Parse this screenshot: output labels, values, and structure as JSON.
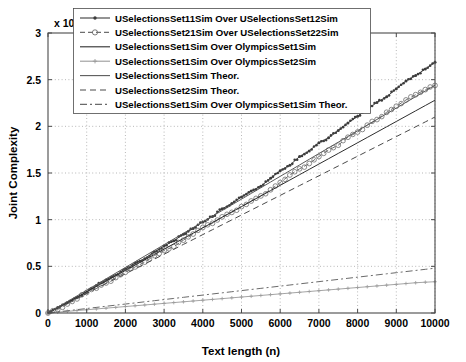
{
  "chart": {
    "type": "line",
    "title": "",
    "xlabel": "Text length (n)",
    "ylabel": "Joint Complexity",
    "y_exponent_prefix": "x 10",
    "y_exponent_power": "4",
    "xlim": [
      0,
      10000
    ],
    "ylim": [
      0,
      30000
    ],
    "xticks": [
      "0",
      "1000",
      "2000",
      "3000",
      "4000",
      "5000",
      "6000",
      "7000",
      "8000",
      "9000",
      "10000"
    ],
    "yticks": [
      "0",
      "0.5",
      "1",
      "1.5",
      "2",
      "2.5",
      "3"
    ],
    "grid": true,
    "legend_position": "top-center"
  },
  "legend": {
    "entries": [
      {
        "label": "USelectionsSet11Sim Over USelectionsSet12Sim",
        "style": "solid-dot",
        "color": "#3c3c3c"
      },
      {
        "label": "USelectionsSet21Sim Over USelectionsSet22Sim",
        "style": "dashed-circle",
        "color": "#6e6e6e"
      },
      {
        "label": "USelectionsSet1Sim Over OlympicsSet1Sim",
        "style": "solid",
        "color": "#2e2e2e"
      },
      {
        "label": "USelectionsSet1Sim Over OlympicsSet2Sim",
        "style": "solid-plus",
        "color": "#9a9a9a"
      },
      {
        "label": "USelectionsSet1Sim Theor.",
        "style": "solid",
        "color": "#5a5a5a"
      },
      {
        "label": "USelectionsSet2Sim Theor.",
        "style": "dashed",
        "color": "#4a4a4a"
      },
      {
        "label": "USelectionsSet1Sim Over OlympicsSet1Sim Theor.",
        "style": "dashdot",
        "color": "#6a6a6a"
      }
    ]
  },
  "chart_data": {
    "type": "line",
    "title": "",
    "xlabel": "Text length (n)",
    "ylabel": "Joint Complexity",
    "xlim": [
      0,
      10000
    ],
    "ylim": [
      0,
      30000
    ],
    "y_scale_factor": 10000,
    "grid": true,
    "legend_position": "top-center",
    "x": [
      0,
      250,
      500,
      750,
      1000,
      1250,
      1500,
      1750,
      2000,
      2250,
      2500,
      2750,
      3000,
      3250,
      3500,
      3750,
      4000,
      4250,
      4500,
      4750,
      5000,
      5250,
      5500,
      5750,
      6000,
      6250,
      6500,
      6750,
      7000,
      7250,
      7500,
      7750,
      8000,
      8250,
      8500,
      8750,
      9000,
      9250,
      9500,
      9750,
      10000
    ],
    "series": [
      {
        "name": "USelectionsSet11Sim Over USelectionsSet12Sim",
        "style": "solid-dot",
        "color": "#3c3c3c",
        "values": [
          0,
          520,
          1080,
          1680,
          2280,
          2880,
          3480,
          4080,
          4700,
          5320,
          5930,
          6530,
          7150,
          7760,
          8360,
          9100,
          9780,
          10400,
          11050,
          11680,
          12350,
          13000,
          13680,
          14400,
          15150,
          15900,
          16700,
          17450,
          18150,
          18850,
          19600,
          20350,
          21100,
          21850,
          22550,
          23250,
          24000,
          24750,
          25500,
          26200,
          26800
        ]
      },
      {
        "name": "USelectionsSet21Sim Over USelectionsSet22Sim",
        "style": "dashed-circle",
        "color": "#6e6e6e",
        "values": [
          0,
          480,
          1000,
          1550,
          2100,
          2650,
          3200,
          3780,
          4350,
          4920,
          5480,
          6050,
          6620,
          7180,
          7750,
          8420,
          9060,
          9620,
          10200,
          10780,
          11400,
          12000,
          12640,
          13300,
          14000,
          14700,
          15430,
          16100,
          16750,
          17400,
          18100,
          18800,
          19500,
          20150,
          20800,
          21450,
          22100,
          22750,
          23400,
          23950,
          24400
        ]
      },
      {
        "name": "USelectionsSet1Sim Over OlympicsSet1Sim",
        "style": "solid",
        "color": "#2e2e2e",
        "values": [
          0,
          570,
          1140,
          1710,
          2280,
          2850,
          3420,
          3990,
          4560,
          5130,
          5700,
          6270,
          6840,
          7410,
          7980,
          8550,
          9120,
          9690,
          10260,
          10830,
          11400,
          11970,
          12540,
          13110,
          13680,
          14250,
          14820,
          15390,
          15960,
          16530,
          17100,
          17670,
          18240,
          18810,
          19380,
          19950,
          20520,
          21090,
          21660,
          22230,
          22800
        ]
      },
      {
        "name": "USelectionsSet1Sim Over OlympicsSet2Sim",
        "style": "solid-plus",
        "color": "#9a9a9a",
        "values": [
          0,
          90,
          175,
          262,
          348,
          434,
          520,
          605,
          690,
          775,
          860,
          945,
          1030,
          1115,
          1200,
          1285,
          1370,
          1455,
          1540,
          1625,
          1710,
          1795,
          1880,
          1965,
          2050,
          2135,
          2220,
          2305,
          2390,
          2475,
          2560,
          2645,
          2730,
          2815,
          2900,
          2985,
          3070,
          3155,
          3240,
          3300,
          3350
        ]
      },
      {
        "name": "USelectionsSet1Sim Theor.",
        "style": "solid",
        "color": "#5a5a5a",
        "values": [
          0,
          610,
          1220,
          1830,
          2440,
          3050,
          3660,
          4270,
          4880,
          5490,
          6100,
          6710,
          7320,
          7930,
          8540,
          9150,
          9760,
          10370,
          10980,
          11590,
          12200,
          12810,
          13420,
          14030,
          14640,
          15250,
          15860,
          16470,
          17080,
          17690,
          18300,
          18910,
          19520,
          20130,
          20740,
          21350,
          21960,
          22570,
          23180,
          23790,
          24400
        ]
      },
      {
        "name": "USelectionsSet2Sim Theor.",
        "style": "dashed",
        "color": "#4a4a4a",
        "values": [
          0,
          525,
          1050,
          1575,
          2100,
          2625,
          3150,
          3675,
          4200,
          4725,
          5250,
          5775,
          6300,
          6825,
          7350,
          7875,
          8400,
          8925,
          9450,
          9975,
          10500,
          11025,
          11550,
          12075,
          12600,
          13125,
          13650,
          14175,
          14700,
          15225,
          15750,
          16275,
          16800,
          17325,
          17850,
          18375,
          18900,
          19425,
          19950,
          20475,
          21000
        ]
      },
      {
        "name": "USelectionsSet1Sim Over OlympicsSet1Sim Theor.",
        "style": "dashdot",
        "color": "#6a6a6a",
        "values": [
          0,
          120,
          240,
          360,
          480,
          600,
          720,
          840,
          960,
          1080,
          1200,
          1320,
          1440,
          1560,
          1680,
          1800,
          1920,
          2040,
          2160,
          2280,
          2400,
          2520,
          2640,
          2760,
          2880,
          3000,
          3120,
          3240,
          3360,
          3480,
          3600,
          3720,
          3840,
          3960,
          4080,
          4200,
          4320,
          4440,
          4560,
          4680,
          4800
        ]
      }
    ]
  }
}
